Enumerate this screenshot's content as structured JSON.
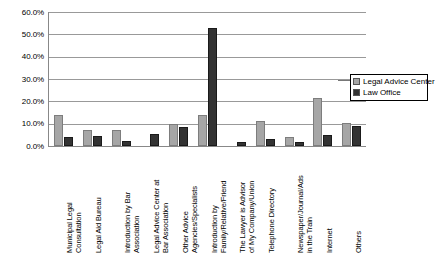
{
  "chart_data": {
    "type": "bar",
    "title": "",
    "xlabel": "",
    "ylabel": "",
    "ylim": [
      0,
      60
    ],
    "grid": true,
    "legend_position": "right",
    "y_ticks": [
      "0.0%",
      "10.0%",
      "20.0%",
      "30.0%",
      "40.0%",
      "50.0%",
      "60.0%"
    ],
    "y_tick_values": [
      0,
      10,
      20,
      30,
      40,
      50,
      60
    ],
    "categories": [
      "Municipal Legal Consultation",
      "Legal Aid Bureau",
      "Introduction by Bar Association",
      "Legal Advice Center at Bar Association",
      "Other Advice Agencies/Specialists",
      "Introduction by Family/Relative/Friend",
      "The Lawyer is Advisor of My Company/Union",
      "Telephone Directory",
      "Newspaper/Journal/Ads in the Train",
      "Internet",
      "Others"
    ],
    "category_lines": [
      [
        "Municipal Legal",
        "Consultation"
      ],
      [
        "Legal Aid Bureau",
        ""
      ],
      [
        "Introduction by Bar",
        "Association"
      ],
      [
        "Legal Advice Center at",
        "Bar Association"
      ],
      [
        "Other Advice",
        "Agencies/Specialists"
      ],
      [
        "Introduction by",
        "Family/Relative/Friend"
      ],
      [
        "The Lawyer is Advisor",
        "of My Company/Union"
      ],
      [
        "Telephone Directory",
        ""
      ],
      [
        "Newspaper/Journal/Ads",
        "in the Train"
      ],
      [
        "Internet",
        ""
      ],
      [
        "Others",
        ""
      ]
    ],
    "series": [
      {
        "name": "Legal Advice Center",
        "color": "#a6a6a6",
        "values": [
          13.8,
          7.0,
          7.0,
          0.0,
          9.7,
          13.7,
          0.0,
          11.0,
          4.2,
          21.5,
          10.5
        ]
      },
      {
        "name": "Law Office",
        "color": "#333333",
        "values": [
          3.9,
          4.6,
          2.1,
          5.2,
          8.7,
          52.9,
          1.8,
          3.0,
          2.0,
          5.0,
          9.0
        ]
      }
    ]
  },
  "legend": {
    "items": [
      {
        "label": "Legal Advice Center",
        "color": "#a6a6a6"
      },
      {
        "label": "Law Office",
        "color": "#333333"
      }
    ]
  }
}
